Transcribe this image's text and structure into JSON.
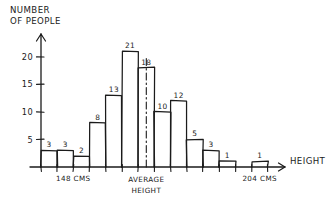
{
  "chart_data": {
    "type": "bar",
    "title": "",
    "subtitle": "",
    "ylabel": "NUMBER OF PEOPLE",
    "xlabel": "HEIGHT",
    "ylim": [
      0,
      23
    ],
    "yticks": [
      5,
      10,
      15,
      20
    ],
    "grid": false,
    "legend": "none",
    "style": "hand-drawn sketch",
    "categories": [
      "bin-1",
      "bin-2",
      "bin-3",
      "bin-4",
      "bin-5",
      "bin-6",
      "bin-7",
      "bin-8",
      "bin-9",
      "bin-10",
      "bin-11",
      "bin-12",
      "bin-13",
      "bin-14"
    ],
    "values": [
      3,
      3,
      2,
      8,
      13,
      21,
      18,
      10,
      12,
      5,
      3,
      1,
      0,
      1
    ],
    "bar_labels": [
      "3",
      "3",
      "2",
      "8",
      "13",
      "21",
      "18",
      "10",
      "12",
      "5",
      "3",
      "1",
      "",
      "1"
    ],
    "annotations": [
      {
        "name": "lower-bin-label",
        "text": "148 CMS",
        "bin": 2
      },
      {
        "name": "average-line-label",
        "text": "AVERAGE",
        "text2": "HEIGHT",
        "bin": 7
      },
      {
        "name": "upper-bin-label",
        "text": "204 CMS",
        "bin": 14
      }
    ],
    "average_marker": {
      "label_line1": "AVERAGE",
      "label_line2": "HEIGHT",
      "style": "dash-dot vertical line",
      "at_bin": 7
    }
  },
  "axes": {
    "y_title_line1": "NUMBER",
    "y_title_line2": "OF PEOPLE",
    "x_title": "HEIGHT",
    "y_tick_labels": [
      "5",
      "10",
      "15",
      "20"
    ]
  },
  "colors": {
    "ink": "#1b1b1b",
    "background": "#ffffff"
  }
}
